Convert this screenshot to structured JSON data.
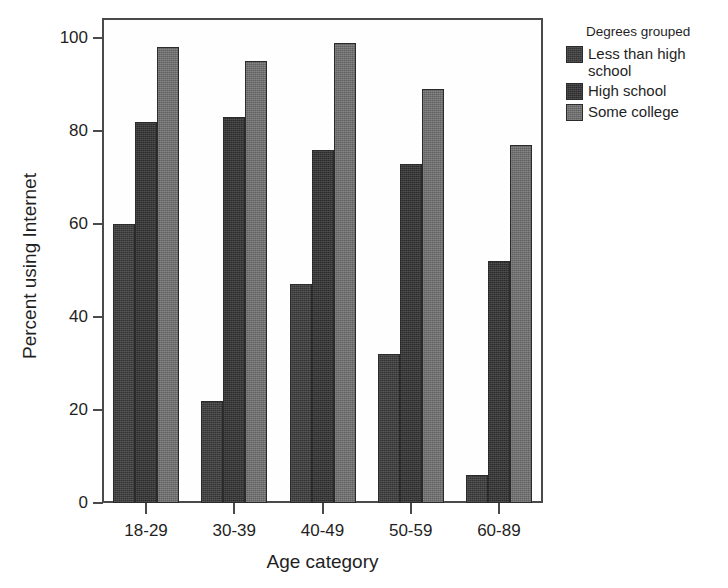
{
  "chart_data": {
    "type": "bar",
    "title": "",
    "xlabel": "Age category",
    "ylabel": "Percent using Internet",
    "categories": [
      "18-29",
      "30-39",
      "40-49",
      "50-59",
      "60-89"
    ],
    "series": [
      {
        "name": "Less than high school",
        "values": [
          60,
          22,
          47,
          32,
          6
        ],
        "color": "#3c3c3c"
      },
      {
        "name": "High school",
        "values": [
          82,
          83,
          76,
          73,
          52
        ],
        "color": "#333333"
      },
      {
        "name": "Some college",
        "values": [
          98,
          95,
          99,
          89,
          77
        ],
        "color": "#727272"
      }
    ],
    "legend_title": "Degrees grouped",
    "legend_position": "right",
    "ylim": [
      0,
      104
    ],
    "yticks": [
      0,
      20,
      40,
      60,
      80,
      100
    ],
    "ytick_labels": [
      "0",
      "20",
      "40",
      "60",
      "80",
      "100"
    ],
    "grid": false
  }
}
